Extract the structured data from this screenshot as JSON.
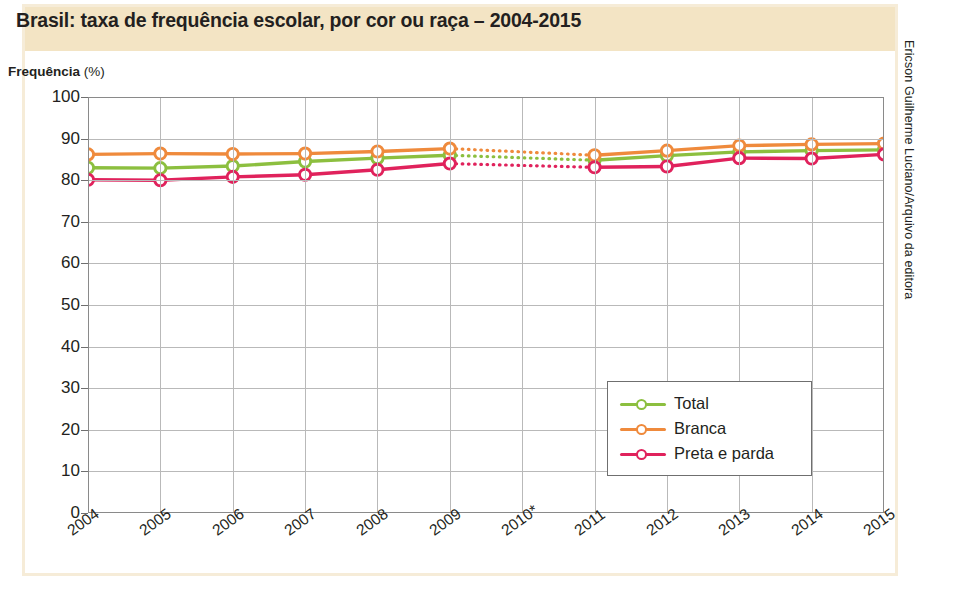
{
  "title": "Brasil: taxa de frequência escolar, por cor ou raça – 2004-2015",
  "y_caption_bold": "Frequência",
  "y_caption_unit": "(%)",
  "credit": "Ericson Guilherme Luciano/Arquivo da editora",
  "legend": {
    "items": [
      {
        "label": "Total",
        "color": "#8cbf3f"
      },
      {
        "label": "Branca",
        "color": "#ef8a3c"
      },
      {
        "label": "Preta e parda",
        "color": "#e0225c"
      }
    ]
  },
  "colors": {
    "band": "#f3e4c4",
    "frame": "#f6ecd8",
    "grid": "#b9b9b9",
    "axis": "#8a8a8a",
    "text": "#231f20",
    "total": "#8cbf3f",
    "branca": "#ef8a3c",
    "preta_parda": "#e0225c"
  },
  "chart_data": {
    "type": "line",
    "title": "Brasil: taxa de frequência escolar, por cor ou raça – 2004-2015",
    "xlabel": "",
    "ylabel": "Frequência (%)",
    "ylim": [
      0,
      100
    ],
    "ytick_labels": [
      "0",
      "10",
      "20",
      "30",
      "40",
      "50",
      "60",
      "70",
      "80",
      "90",
      "100"
    ],
    "yticks": [
      0,
      10,
      20,
      30,
      40,
      50,
      60,
      70,
      80,
      90,
      100
    ],
    "categories": [
      "2004",
      "2005",
      "2006",
      "2007",
      "2008",
      "2009",
      "2010*",
      "2011",
      "2012",
      "2013",
      "2014",
      "2015"
    ],
    "grid": true,
    "legend_position": "center-right",
    "note": "2010 sem dados: trecho entre 2009 e 2011 interpolado (linha pontilhada)",
    "series": [
      {
        "name": "Total",
        "color": "#8cbf3f",
        "values": [
          83.0,
          82.9,
          83.4,
          84.5,
          85.3,
          86.0,
          null,
          84.8,
          85.9,
          86.8,
          87.1,
          87.3
        ]
      },
      {
        "name": "Branca",
        "color": "#ef8a3c",
        "values": [
          86.2,
          86.4,
          86.3,
          86.4,
          86.9,
          87.6,
          null,
          86.0,
          87.1,
          88.3,
          88.6,
          88.8
        ]
      },
      {
        "name": "Preta e parda",
        "color": "#e0225c",
        "values": [
          80.1,
          80.0,
          80.8,
          81.3,
          82.5,
          84.0,
          null,
          83.1,
          83.3,
          85.3,
          85.2,
          86.2
        ]
      }
    ]
  }
}
